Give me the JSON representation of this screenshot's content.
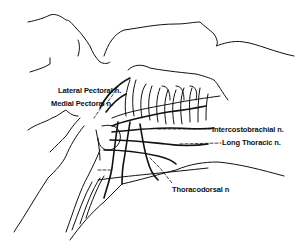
{
  "figure": {
    "labels": [
      {
        "id": "lateral-pectoral",
        "text": "Lateral Pectoral n.",
        "x": 58,
        "y": 87
      },
      {
        "id": "medial-pectoral",
        "text": "Medial Pectoral n.",
        "x": 51,
        "y": 101
      },
      {
        "id": "intercostobrachial",
        "text": "Intercostobrachial n.",
        "x": 212,
        "y": 128
      },
      {
        "id": "long-thoracic",
        "text": "Long Thoracic n.",
        "x": 222,
        "y": 141
      },
      {
        "id": "thoracodorsal",
        "text": "Thoracodorsal n",
        "x": 172,
        "y": 186
      }
    ],
    "colors": {
      "ink": "#111111",
      "background": "#ffffff"
    }
  }
}
